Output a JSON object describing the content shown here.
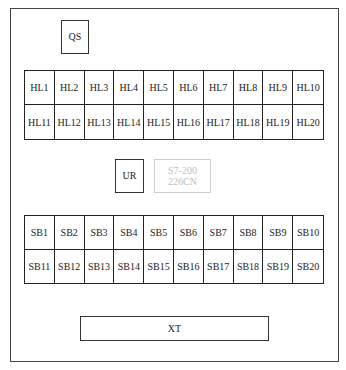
{
  "diagram": {
    "type": "control panel layout",
    "components": {
      "qs": "QS",
      "ur": "UR",
      "plc": {
        "line1": "S7-200",
        "line2": "226CN"
      },
      "xt": "XT"
    },
    "indicator_lights": {
      "row1": [
        "HL1",
        "HL2",
        "HL3",
        "HL4",
        "HL5",
        "HL6",
        "HL7",
        "HL8",
        "HL9",
        "HL10"
      ],
      "row2": [
        "HL11",
        "HL12",
        "HL13",
        "HL14",
        "HL15",
        "HL16",
        "HL17",
        "HL18",
        "HL19",
        "HL20"
      ]
    },
    "buttons": {
      "row1": [
        "SB1",
        "SB2",
        "SB3",
        "SB4",
        "SB5",
        "SB6",
        "SB7",
        "SB8",
        "SB9",
        "SB10"
      ],
      "row2": [
        "SB11",
        "SB12",
        "SB13",
        "SB14",
        "SB15",
        "SB16",
        "SB17",
        "SB18",
        "SB19",
        "SB20"
      ]
    },
    "colors": {
      "line": "#222222",
      "faint_line": "#cfcfcf",
      "faint_text": "#bdbdbd",
      "background": "#ffffff"
    }
  }
}
